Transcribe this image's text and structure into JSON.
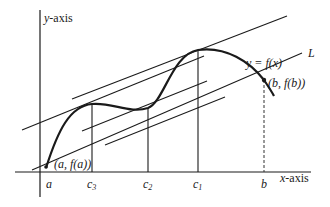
{
  "diagram": {
    "type": "mean-value-theorem-illustration",
    "axes": {
      "y_label": "y-axis",
      "x_label": "x-axis"
    },
    "curve_label": "y = f(x)",
    "line_label": "L",
    "point_a_label": "(a, f(a))",
    "point_b_label": "(b, f(b))",
    "x_ticks": [
      "a",
      "c3",
      "c2",
      "c1",
      "b"
    ],
    "tick_labels": {
      "a": "a",
      "c3_base": "c",
      "c3_sub": "3",
      "c2_base": "c",
      "c2_sub": "2",
      "c1_base": "c",
      "c1_sub": "1",
      "b": "b"
    },
    "colors": {
      "stroke": "#1a1a1a",
      "background": "#ffffff"
    }
  }
}
